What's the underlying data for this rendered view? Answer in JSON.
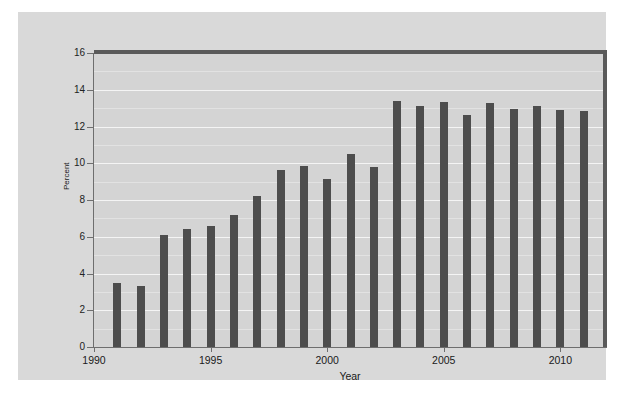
{
  "chart_data": {
    "type": "bar",
    "title": "",
    "xlabel": "Year",
    "ylabel": "Percent",
    "xlim": [
      1990,
      2012
    ],
    "ylim": [
      0,
      16
    ],
    "grid": true,
    "legend": false,
    "y_ticks": [
      0,
      2,
      4,
      6,
      8,
      10,
      12,
      14,
      16
    ],
    "y_tick_labels": [
      "0",
      "2",
      "4",
      "6",
      "8",
      "10",
      "12",
      "14",
      "16"
    ],
    "y_minor_ticks": [
      1,
      3,
      5,
      7,
      9,
      11,
      13,
      15
    ],
    "x_ticks": [
      1990,
      1995,
      2000,
      2005,
      2010
    ],
    "x_tick_labels": [
      "1990",
      "1995",
      "2000",
      "2005",
      "2010"
    ],
    "categories": [
      1991,
      1992,
      1993,
      1994,
      1995,
      1996,
      1997,
      1998,
      1999,
      2000,
      2001,
      2002,
      2003,
      2004,
      2005,
      2006,
      2007,
      2008,
      2009,
      2010,
      2011
    ],
    "values": [
      3.5,
      3.3,
      6.1,
      6.4,
      6.6,
      7.2,
      8.2,
      9.65,
      9.85,
      9.15,
      10.5,
      9.8,
      13.4,
      13.1,
      13.35,
      12.65,
      13.3,
      12.95,
      13.1,
      12.9,
      12.85
    ],
    "bar_color": "#4d4d4d",
    "panel_color": "#d4d4d4",
    "gridline_color": "#f4f4f4",
    "axis_color": "#6e6e6e"
  }
}
